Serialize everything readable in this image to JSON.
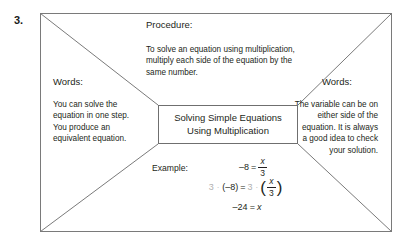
{
  "problem": {
    "number": "3."
  },
  "center_box": {
    "line1": "Solving Simple Equations",
    "line2": "Using Multiplication"
  },
  "procedure": {
    "heading": "Procedure:",
    "lines": [
      "To solve an equation using multiplication,",
      "multiply each side of the equation by the",
      "same number."
    ]
  },
  "words_left": {
    "heading": "Words:",
    "lines": [
      "You can solve the",
      "equation in one step.",
      "You produce an",
      "equivalent equation."
    ]
  },
  "words_right": {
    "heading": "Words:",
    "lines": [
      "The variable can be on",
      "either side of the",
      "equation. It is always",
      "a good idea to check",
      "your solution."
    ]
  },
  "example": {
    "label": "Example:",
    "step1": {
      "lhs": "–8",
      "eq": "=",
      "num": "x",
      "den": "3"
    },
    "step2": {
      "factor_left": "3",
      "dot": "·",
      "lhs": "(–8)",
      "eq": "=",
      "factor_right": "3",
      "dot2": "·",
      "num": "x",
      "den": "3"
    },
    "step3": {
      "lhs": "–24",
      "eq": "=",
      "rhs": "x"
    }
  },
  "colors": {
    "ink": "#231f20",
    "rule": "#7a7a7a",
    "pencil_gray": "#b0b0b0"
  }
}
